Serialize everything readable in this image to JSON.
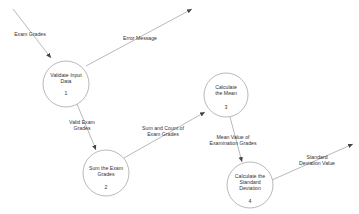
{
  "diagram": {
    "type": "data-flow-diagram",
    "processes": [
      {
        "id": "1",
        "label": "Validate Input Data",
        "line1": "Validate Input",
        "line2": "Data",
        "cx": 66,
        "cy": 84,
        "r": 23
      },
      {
        "id": "2",
        "label": "Sum the Exam Grades",
        "line1": "Sum the Exam",
        "line2": "Grades",
        "cx": 106,
        "cy": 173,
        "r": 23
      },
      {
        "id": "3",
        "label": "Calculate the Mean",
        "line1": "Calculate",
        "line2": "the Mean",
        "cx": 226,
        "cy": 95,
        "r": 22
      },
      {
        "id": "4",
        "label": "Calculate the Standard Deviation",
        "line1": "Calculate the",
        "line2": "Standard",
        "line3": "Deviation",
        "cx": 250,
        "cy": 185,
        "r": 23
      }
    ],
    "flows": [
      {
        "label": "Exam Grades",
        "from": "external",
        "to": "1",
        "line1": "Exam Grades"
      },
      {
        "label": "Error Message",
        "from": "1",
        "to": "external",
        "line1": "Error Message"
      },
      {
        "label": "Valid Exam Grades",
        "from": "1",
        "to": "2",
        "line1": "Valid Exam",
        "line2": "Grades"
      },
      {
        "label": "Sum and Count of Exam Grades",
        "from": "2",
        "to": "3",
        "line1": "Sum and Count of",
        "line2": "Exam Grades"
      },
      {
        "label": "Mean Value of Examination Grades",
        "from": "3",
        "to": "4",
        "line1": "Mean Value of",
        "line2": "Examination Grades"
      },
      {
        "label": "Standard Deviation Value",
        "from": "4",
        "to": "external",
        "line1": "Standard",
        "line2": "Deviation Value"
      }
    ],
    "colors": {
      "stroke": "#8a8a8a",
      "text": "#333333",
      "background": "#ffffff"
    }
  }
}
